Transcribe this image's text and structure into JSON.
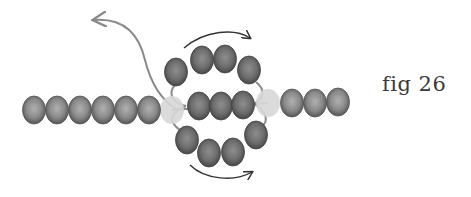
{
  "figure": {
    "caption": "fig 26",
    "colors": {
      "bead_dark": "#5a5a5a",
      "bead_mid": "#8c8c8c",
      "bead_highlight": "#b4b4b4",
      "bead_light": "#d6d6d6",
      "thread": "#8a8a8a",
      "arrow": "#333333"
    },
    "left_chain": [
      [
        34,
        110
      ],
      [
        57,
        110
      ],
      [
        80,
        110
      ],
      [
        103,
        110
      ],
      [
        126,
        110
      ],
      [
        149,
        110
      ]
    ],
    "light_beads": [
      [
        172,
        110
      ],
      [
        268,
        103
      ]
    ],
    "middle_row": [
      [
        199,
        106
      ],
      [
        221,
        106
      ],
      [
        243,
        105
      ]
    ],
    "top_arc": [
      [
        176,
        72
      ],
      [
        202,
        60
      ],
      [
        225,
        59
      ],
      [
        249,
        70
      ]
    ],
    "bottom_arc": [
      [
        187,
        140
      ],
      [
        209,
        153
      ],
      [
        233,
        152
      ],
      [
        256,
        135
      ]
    ],
    "right_chain": [
      [
        292,
        103
      ],
      [
        315,
        103
      ],
      [
        338,
        102
      ]
    ]
  }
}
